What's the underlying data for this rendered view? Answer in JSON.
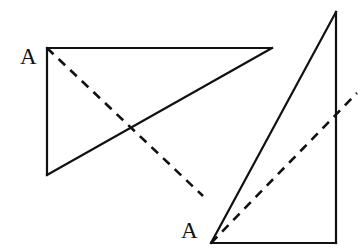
{
  "figure": {
    "background_color": "#ffffff",
    "stroke_color": "#111111",
    "canvas": {
      "width": 364,
      "height": 252
    },
    "labels": [
      {
        "id": "label-a-left",
        "text": "A",
        "x": 20,
        "y": 45,
        "attached_to": "left-triangle-vertex-a"
      },
      {
        "id": "label-a-right",
        "text": "A",
        "x": 181,
        "y": 219,
        "attached_to": "right-triangle-vertex-a"
      }
    ],
    "shapes": [
      {
        "id": "left-triangle",
        "kind": "triangle",
        "style": "solid",
        "stroke_width": 2.2,
        "points": [
          [
            47,
            48
          ],
          [
            272,
            48
          ],
          [
            47,
            175
          ]
        ],
        "vertex_a": [
          47,
          48
        ]
      },
      {
        "id": "right-triangle",
        "kind": "triangle",
        "style": "solid",
        "stroke_width": 2.2,
        "points": [
          [
            211,
            243
          ],
          [
            336,
            243
          ],
          [
            336,
            12
          ]
        ],
        "vertex_a": [
          211,
          243
        ]
      }
    ],
    "dashed_lines": [
      {
        "id": "left-dashed-cevian",
        "from": [
          47,
          48
        ],
        "to": [
          203,
          196
        ],
        "stroke_width": 2.6,
        "dash": "9 7"
      },
      {
        "id": "right-dashed-cevian",
        "from": [
          211,
          243
        ],
        "to": [
          357,
          93
        ],
        "stroke_width": 2.6,
        "dash": "9 7"
      }
    ]
  }
}
